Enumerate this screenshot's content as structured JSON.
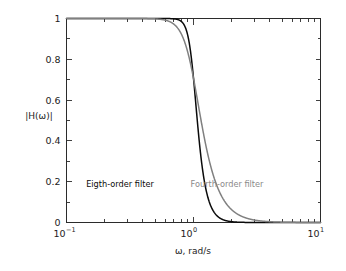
{
  "figure": {
    "background_color": "#ffffff",
    "frame_color": "#2b2b2b",
    "width": 346,
    "height": 271
  },
  "chart_data": {
    "type": "line",
    "title": "",
    "xlabel": "ω, rad/s",
    "ylabel": "|H(ω)|",
    "xscale": "log",
    "yscale": "linear",
    "xlim": [
      0.1,
      10
    ],
    "ylim": [
      0,
      1
    ],
    "grid": false,
    "legend_position": "inline-annotations",
    "x_tick_labels": [
      "10⁻¹",
      "10⁰",
      "10¹"
    ],
    "x_tick_values": [
      0.1,
      1,
      10
    ],
    "x_tick_mantissa": [
      "10",
      "10",
      "10"
    ],
    "x_tick_exponent": [
      "-1",
      "0",
      "1"
    ],
    "y_tick_labels": [
      "0",
      "0.2",
      "0.4",
      "0.6",
      "0.8",
      "1"
    ],
    "y_tick_values": [
      0,
      0.2,
      0.4,
      0.6,
      0.8,
      1
    ],
    "x_minor_ticks_per_decade": [
      2,
      3,
      4,
      5,
      6,
      7,
      8,
      9
    ],
    "series": [
      {
        "name": "Eigth-order filter",
        "color": "#0a0a0a",
        "line_width": 1.5,
        "filter_order": 8,
        "cutoff_rad_s": 1,
        "formula": "1/sqrt(1+w^16)",
        "x": [
          0.1,
          0.2,
          0.3,
          0.4,
          0.5,
          0.6,
          0.7,
          0.75,
          0.8,
          0.85,
          0.9,
          0.95,
          1.0,
          1.05,
          1.1,
          1.15,
          1.2,
          1.3,
          1.4,
          1.5,
          1.6,
          1.8,
          2.0,
          2.5,
          3.0,
          4.0,
          6.0,
          10.0
        ],
        "y": [
          1.0,
          1.0,
          1.0,
          1.0,
          1.0,
          0.999,
          0.993,
          0.983,
          0.961,
          0.917,
          0.838,
          0.714,
          0.707,
          0.453,
          0.286,
          0.171,
          0.1,
          0.035,
          0.013,
          0.005,
          0.002,
          0.001,
          0.0004,
          0.0001,
          0.0,
          0.0,
          0.0,
          0.0
        ]
      },
      {
        "name": "Fourth-order filter",
        "color": "#808080",
        "line_width": 1.5,
        "filter_order": 4,
        "cutoff_rad_s": 1,
        "formula": "1/sqrt(1+w^8)",
        "x": [
          0.1,
          0.2,
          0.3,
          0.4,
          0.5,
          0.6,
          0.7,
          0.8,
          0.9,
          1.0,
          1.1,
          1.2,
          1.3,
          1.4,
          1.5,
          1.6,
          1.8,
          2.0,
          2.5,
          3.0,
          4.0,
          6.0,
          10.0
        ],
        "y": [
          1.0,
          1.0,
          0.9999,
          0.9997,
          0.998,
          0.991,
          0.971,
          0.922,
          0.83,
          0.707,
          0.569,
          0.442,
          0.337,
          0.256,
          0.195,
          0.15,
          0.092,
          0.062,
          0.026,
          0.012,
          0.004,
          0.0008,
          0.0001
        ]
      }
    ],
    "annotations": [
      {
        "text": "Eigth-order filter",
        "color": "#0a0a0a",
        "x_px": 120,
        "y_px": 187
      },
      {
        "text": "Fourth-order filter",
        "color": "#8a8a8a",
        "x_px": 227,
        "y_px": 187
      }
    ]
  }
}
